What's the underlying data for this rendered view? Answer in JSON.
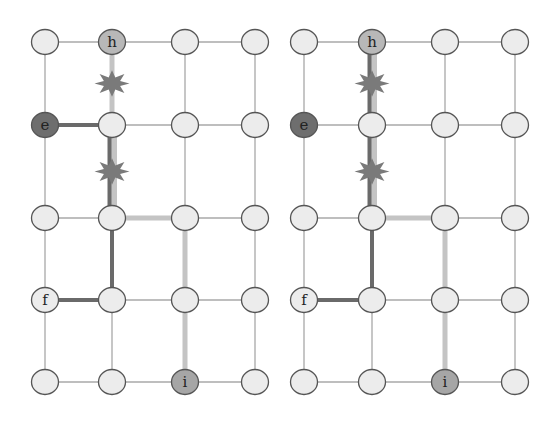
{
  "colors": {
    "grid_edge": "#a8a8a8",
    "node_fill": "#ececec",
    "node_stroke": "#555555",
    "node_h_fill": "#b8b8b8",
    "node_e_fill": "#6e6e6e",
    "node_i_fill": "#a6a6a6",
    "path_dark": "#6a6a6a",
    "path_light": "#c4c4c4",
    "star_fill": "#7a7a7a"
  },
  "rows_y": [
    42,
    125,
    218,
    300,
    382
  ],
  "panels": [
    {
      "name": "left-grid",
      "cols_x": [
        45,
        112,
        185,
        255
      ],
      "labels": [
        {
          "text": "h",
          "col": 1,
          "row": 0
        },
        {
          "text": "e",
          "col": 0,
          "row": 1
        },
        {
          "text": "f",
          "col": 0,
          "row": 3
        },
        {
          "text": "i",
          "col": 2,
          "row": 4
        }
      ],
      "stars": [
        {
          "col": 1,
          "between_rows": [
            0,
            1
          ]
        },
        {
          "col": 1,
          "between_rows": [
            1,
            2
          ]
        }
      ],
      "paths": [
        {
          "from": [
            0,
            1
          ],
          "to": [
            1,
            1
          ],
          "style": "dark"
        },
        {
          "from": [
            1,
            0
          ],
          "to": [
            1,
            1
          ],
          "style": "light"
        },
        {
          "from": [
            1,
            1
          ],
          "to": [
            1,
            2
          ],
          "style": "light+dark"
        },
        {
          "from": [
            1,
            2
          ],
          "to": [
            2,
            2
          ],
          "style": "light"
        },
        {
          "from": [
            2,
            2
          ],
          "to": [
            2,
            4
          ],
          "style": "light"
        },
        {
          "from": [
            1,
            2
          ],
          "to": [
            1,
            3
          ],
          "style": "dark"
        },
        {
          "from": [
            0,
            3
          ],
          "to": [
            1,
            3
          ],
          "style": "dark"
        }
      ]
    },
    {
      "name": "right-grid",
      "cols_x": [
        304,
        372,
        445,
        515
      ],
      "labels": [
        {
          "text": "h",
          "col": 1,
          "row": 0
        },
        {
          "text": "e",
          "col": 0,
          "row": 1
        },
        {
          "text": "f",
          "col": 0,
          "row": 3
        },
        {
          "text": "i",
          "col": 2,
          "row": 4
        }
      ],
      "stars": [
        {
          "col": 1,
          "between_rows": [
            0,
            1
          ]
        },
        {
          "col": 1,
          "between_rows": [
            1,
            2
          ]
        }
      ],
      "paths": [
        {
          "from": [
            1,
            0
          ],
          "to": [
            1,
            1
          ],
          "style": "light+dark"
        },
        {
          "from": [
            1,
            1
          ],
          "to": [
            1,
            2
          ],
          "style": "light+dark"
        },
        {
          "from": [
            1,
            2
          ],
          "to": [
            2,
            2
          ],
          "style": "light"
        },
        {
          "from": [
            2,
            2
          ],
          "to": [
            2,
            4
          ],
          "style": "light"
        },
        {
          "from": [
            1,
            2
          ],
          "to": [
            1,
            3
          ],
          "style": "dark"
        },
        {
          "from": [
            0,
            3
          ],
          "to": [
            1,
            3
          ],
          "style": "dark"
        }
      ]
    }
  ]
}
